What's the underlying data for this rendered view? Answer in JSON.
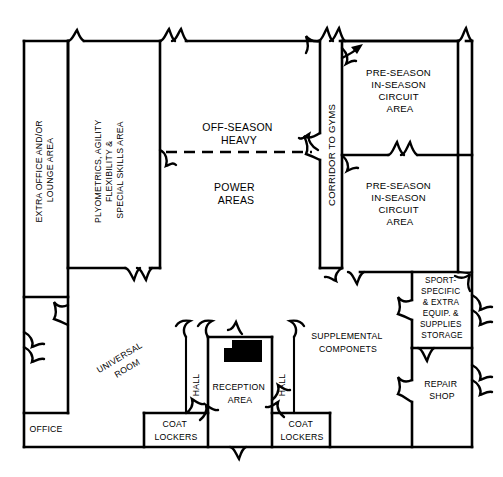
{
  "diagram": {
    "type": "architectural-floor-plan",
    "stroke_color": "#000000",
    "background_color": "#ffffff",
    "accent_fill": "#000000"
  },
  "rooms": {
    "extra_office": {
      "label_line1": "EXTRA OFFICE AND/OR",
      "label_line2": "LOUNGE AREA",
      "orientation": "vertical-bottom-up"
    },
    "plyometrics": {
      "label_line1": "PLYOMETRICS, AGILITY",
      "label_line2": "FLEXIBILITY &",
      "label_line3": "SPECIAL SKILLS AREA",
      "orientation": "vertical-bottom-up"
    },
    "off_season": {
      "label_line1": "OFF-SEASON",
      "label_line2": "HEAVY",
      "orientation": "horizontal"
    },
    "power_areas": {
      "label_line1": "POWER",
      "label_line2": "AREAS",
      "orientation": "horizontal"
    },
    "corridor": {
      "label": "CORRIDOR TO GYMS",
      "orientation": "vertical-bottom-up"
    },
    "circuit_upper": {
      "label_line1": "PRE-SEASON",
      "label_line2": "IN-SEASON",
      "label_line3": "CIRCUIT",
      "label_line4": "AREA",
      "orientation": "horizontal"
    },
    "circuit_lower": {
      "label_line1": "PRE-SEASON",
      "label_line2": "IN-SEASON",
      "label_line3": "CIRCUIT",
      "label_line4": "AREA",
      "orientation": "horizontal"
    },
    "sport_storage": {
      "label_line1": "SPORT-",
      "label_line2": "SPECIFIC",
      "label_line3": "& EXTRA",
      "label_line4": "EQUIP. &",
      "label_line5": "SUPPLIES",
      "label_line6": "STORAGE",
      "orientation": "horizontal"
    },
    "repair_shop": {
      "label_line1": "REPAIR",
      "label_line2": "SHOP",
      "orientation": "horizontal"
    },
    "supplemental": {
      "label_line1": "SUPPLEMENTAL",
      "label_line2": "COMPONETS",
      "orientation": "horizontal"
    },
    "universal_room": {
      "label_line1": "UNIVERSAL",
      "label_line2": "ROOM",
      "orientation": "diagonal"
    },
    "reception": {
      "label_line1": "RECEPTION",
      "label_line2": "AREA",
      "orientation": "horizontal"
    },
    "hall_left": {
      "label": "HALL",
      "orientation": "vertical-bottom-up"
    },
    "hall_right": {
      "label": "HALL",
      "orientation": "vertical-bottom-up"
    },
    "coat_lockers_left": {
      "label_line1": "COAT",
      "label_line2": "LOCKERS",
      "orientation": "horizontal"
    },
    "coat_lockers_right": {
      "label_line1": "COAT",
      "label_line2": "LOCKERS",
      "orientation": "horizontal"
    },
    "office": {
      "label": "OFFICE",
      "orientation": "horizontal"
    }
  },
  "annotations": {
    "corridor_entry_arrow": "arrow-pointing-into-circuit-area",
    "reception_desk": "reception-desk-solid-black",
    "power_divider": "dashed-zone-divider"
  }
}
